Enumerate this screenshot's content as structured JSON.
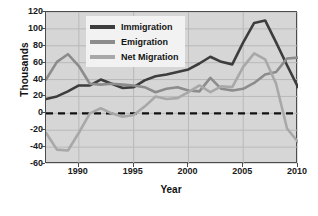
{
  "chart_data": {
    "type": "line",
    "title": "",
    "xlabel": "Year",
    "ylabel": "Thousands",
    "xlim": [
      1987,
      2010
    ],
    "ylim": [
      -60,
      120
    ],
    "xticks": [
      1990,
      1995,
      2000,
      2005,
      2010
    ],
    "yticks": [
      -60,
      -40,
      -20,
      0,
      20,
      40,
      60,
      80,
      100,
      120
    ],
    "grid": true,
    "legend_position": "upper-left-inside",
    "zero_line": 0,
    "x": [
      1987,
      1988,
      1989,
      1990,
      1991,
      1992,
      1993,
      1994,
      1995,
      1996,
      1997,
      1998,
      1999,
      2000,
      2001,
      2002,
      2003,
      2004,
      2005,
      2006,
      2007,
      2008,
      2009,
      2010
    ],
    "series": [
      {
        "name": "Immigration",
        "color": "#3d3d3d",
        "values": [
          17,
          20,
          26,
          33,
          33,
          40,
          35,
          30,
          31,
          39,
          44,
          46,
          49,
          52,
          59,
          67,
          61,
          58,
          84,
          107,
          110,
          84,
          57,
          31
        ]
      },
      {
        "name": "Emigration",
        "color": "#8c8c8c",
        "values": [
          40,
          61,
          70,
          56,
          35,
          34,
          35,
          34,
          33,
          31,
          25,
          29,
          31,
          27,
          26,
          42,
          29,
          27,
          29,
          36,
          46,
          49,
          65,
          66
        ]
      },
      {
        "name": "Net Migration",
        "color": "#a8a8a8",
        "values": [
          -23,
          -43,
          -44,
          -23,
          0,
          6,
          0,
          -4,
          -2,
          8,
          20,
          17,
          18,
          25,
          33,
          25,
          32,
          31,
          55,
          71,
          64,
          35,
          -18,
          -34
        ]
      }
    ]
  },
  "legend": {
    "items": [
      {
        "label": "Immigration"
      },
      {
        "label": "Emigration"
      },
      {
        "label": "Net Migration"
      }
    ]
  },
  "axes": {
    "y_label": "Thousands",
    "x_label": "Year",
    "y_tick_labels": [
      "120",
      "100",
      "80",
      "60",
      "40",
      "20",
      "0",
      "-20",
      "-40",
      "-60"
    ],
    "x_tick_labels": [
      "1990",
      "1995",
      "2000",
      "2005",
      "2010"
    ]
  }
}
